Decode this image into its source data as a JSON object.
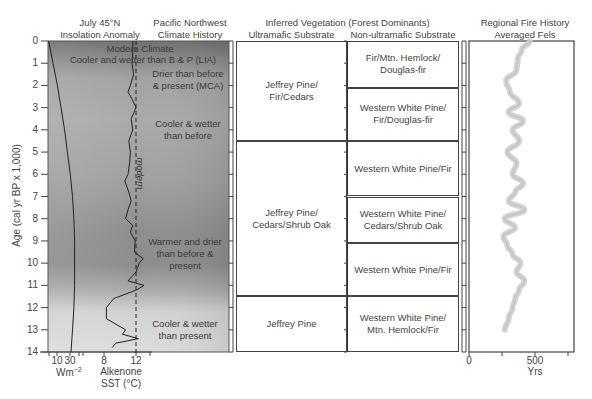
{
  "headers": {
    "insolation": [
      "July 45°N",
      "Insolation Anomaly"
    ],
    "climate": [
      "Pacific Northwest",
      "Climate History"
    ],
    "vegetation_title": "Inferred Vegetation (Forest Dominants)",
    "ultramafic": "Ultramafic Substrate",
    "non_ultramafic": "Non-ultramafic Substrate",
    "fire": [
      "Regional Fire History",
      "Averaged Fels"
    ]
  },
  "y_axis": {
    "label": "Age (cal yr BP x 1,000)",
    "ticks": [
      "0",
      "1",
      "2",
      "3",
      "4",
      "5",
      "6",
      "7",
      "8",
      "9",
      "10",
      "11",
      "12",
      "13",
      "14"
    ]
  },
  "x_axes": {
    "insolation": {
      "ticks": [
        "10",
        "30"
      ],
      "unit": "Wm",
      "unit_sup": "−2"
    },
    "sst": {
      "ticks": [
        "8",
        "12"
      ],
      "label": [
        "Alkenone",
        "SST (°C)"
      ]
    },
    "fire": {
      "ticks": [
        "0",
        "500"
      ],
      "label": "Yrs"
    }
  },
  "modern_label": "modern",
  "climate_history": [
    {
      "text": [
        "Modern Climate"
      ],
      "age": 0.35
    },
    {
      "text": [
        "Cooler and wetter than B & P (LIA)"
      ],
      "age": 0.85
    },
    {
      "text": [
        "Drier than before",
        "& present (MCA)"
      ],
      "age": 1.75
    },
    {
      "text": [
        "Cooler & wetter",
        "than before"
      ],
      "age": 4.0
    },
    {
      "text": [
        "Warmer and drier",
        "than before &",
        "present"
      ],
      "age": 9.6
    },
    {
      "text": [
        "Cooler & wetter",
        "than present"
      ],
      "age": 13.0
    }
  ],
  "vegetation": {
    "ultramafic": [
      {
        "label": [
          "Jeffrey Pine/",
          "Fir/Cedars"
        ],
        "from": 0,
        "to": 4.5
      },
      {
        "label": [
          "Jeffrey Pine/",
          "Cedars/Shrub Oak"
        ],
        "from": 4.5,
        "to": 11.5
      },
      {
        "label": [
          "Jeffrey Pine"
        ],
        "from": 11.5,
        "to": 14
      }
    ],
    "non_ultramafic": [
      {
        "label": [
          "Fir/Mtn. Hemlock/",
          "Douglas-fir"
        ],
        "from": 0,
        "to": 2.1
      },
      {
        "label": [
          "Western White Pine/",
          "Fir/Douglas-fir"
        ],
        "from": 2.1,
        "to": 4.5
      },
      {
        "label": [
          "Western White Pine/Fir"
        ],
        "from": 4.5,
        "to": 7.0
      },
      {
        "label": [
          "Western White Pine/",
          "Cedars/Shrub Oak"
        ],
        "from": 7.0,
        "to": 9.1
      },
      {
        "label": [
          "Western White Pine/Fir"
        ],
        "from": 9.1,
        "to": 11.5
      },
      {
        "label": [
          "Western White Pine/",
          "Mtn. Hemlock/Fir"
        ],
        "from": 11.5,
        "to": 14
      }
    ]
  },
  "chart_data": [
    {
      "type": "line",
      "title": "July 45°N Insolation Anomaly",
      "xlabel": "Wm^-2",
      "ylabel": "Age (cal yr BP x 1,000)",
      "x_ticks": [
        10,
        30
      ],
      "ylim": [
        0,
        14
      ],
      "series": [
        {
          "name": "Insolation anomaly",
          "age": [
            0,
            1,
            2,
            3,
            4,
            5,
            6,
            7,
            8,
            9,
            10,
            11,
            12,
            13,
            14
          ],
          "values": [
            -4,
            2,
            8,
            13,
            18,
            22,
            26,
            29,
            31,
            32,
            32,
            32,
            31,
            29,
            27
          ]
        }
      ]
    },
    {
      "type": "line",
      "title": "Alkenone SST (°C)",
      "xlabel": "Alkenone SST (°C)",
      "x_ticks": [
        8,
        12
      ],
      "ylim": [
        0,
        14
      ],
      "reference_line": {
        "value": 12,
        "label": "modern",
        "style": "dashed"
      },
      "series": [
        {
          "name": "Alkenone SST",
          "age": [
            0,
            0.5,
            1,
            1.5,
            2,
            2.3,
            2.6,
            3,
            3.5,
            4,
            4.5,
            5,
            5.5,
            6,
            6.3,
            6.8,
            7.2,
            7.6,
            8,
            8.3,
            8.6,
            9,
            9.5,
            9.8,
            10,
            10.4,
            10.8,
            11,
            11.2,
            11.6,
            12,
            12.5,
            13,
            13.2,
            13.4,
            13.6,
            13.8
          ],
          "values": [
            11.6,
            11.6,
            11.5,
            11.7,
            11.3,
            11.0,
            11.5,
            12.0,
            11.4,
            11.6,
            11.1,
            11.3,
            11.2,
            11.0,
            10.6,
            11.1,
            11.4,
            11.0,
            10.7,
            11.6,
            11.3,
            11.9,
            11.8,
            12.9,
            12.4,
            12.0,
            11.0,
            13.0,
            12.1,
            9.2,
            8.3,
            8.3,
            10.7,
            10.3,
            12.3,
            9.5,
            9.0
          ]
        }
      ]
    },
    {
      "type": "table",
      "title": "Inferred Vegetation (Forest Dominants)",
      "columns": [
        "Ultramafic Substrate",
        "Non-ultramafic Substrate"
      ],
      "rows_ultramafic": [
        {
          "age_range": [
            0,
            4.5
          ],
          "value": "Jeffrey Pine/Fir/Cedars"
        },
        {
          "age_range": [
            4.5,
            11.5
          ],
          "value": "Jeffrey Pine/Cedars/Shrub Oak"
        },
        {
          "age_range": [
            11.5,
            14
          ],
          "value": "Jeffrey Pine"
        }
      ],
      "rows_non_ultramafic": [
        {
          "age_range": [
            0,
            2.1
          ],
          "value": "Fir/Mtn. Hemlock/Douglas-fir"
        },
        {
          "age_range": [
            2.1,
            4.5
          ],
          "value": "Western White Pine/Fir/Douglas-fir"
        },
        {
          "age_range": [
            4.5,
            7.0
          ],
          "value": "Western White Pine/Fir"
        },
        {
          "age_range": [
            7.0,
            9.1
          ],
          "value": "Western White Pine/Cedars/Shrub Oak"
        },
        {
          "age_range": [
            9.1,
            11.5
          ],
          "value": "Western White Pine/Fir"
        },
        {
          "age_range": [
            11.5,
            14
          ],
          "value": "Western White Pine/Mtn. Hemlock/Fir"
        }
      ]
    },
    {
      "type": "line",
      "title": "Regional Fire History Averaged Fels",
      "xlabel": "Yrs",
      "x_ticks": [
        0,
        500
      ],
      "xlim": [
        0,
        750
      ],
      "ylim": [
        0,
        14
      ],
      "series": [
        {
          "name": "Fire episode return interval (averaged)",
          "age": [
            0,
            0.4,
            0.8,
            1.3,
            1.8,
            2.3,
            2.8,
            3.2,
            3.6,
            4.0,
            4.5,
            5.0,
            5.5,
            6.0,
            6.4,
            6.8,
            7.2,
            7.6,
            8.0,
            8.4,
            8.8,
            9.2,
            9.6,
            10.0,
            10.4,
            10.8,
            11.2,
            11.6,
            12.0,
            12.5,
            13.0
          ],
          "values": [
            460,
            400,
            370,
            360,
            280,
            310,
            380,
            300,
            410,
            330,
            380,
            290,
            360,
            330,
            410,
            350,
            300,
            420,
            270,
            350,
            260,
            290,
            330,
            390,
            360,
            420,
            380,
            350,
            330,
            300,
            270
          ]
        }
      ]
    }
  ]
}
